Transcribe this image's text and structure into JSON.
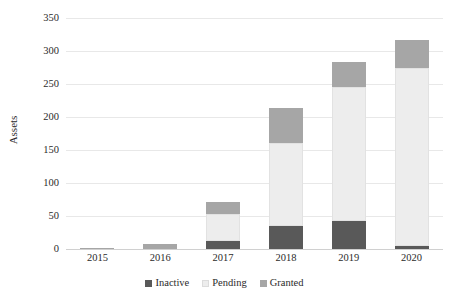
{
  "chart_data": {
    "type": "bar",
    "stacked": true,
    "title": "",
    "xlabel": "",
    "ylabel": "Assets",
    "categories": [
      "2015",
      "2016",
      "2017",
      "2018",
      "2019",
      "2020"
    ],
    "series": [
      {
        "name": "Inactive",
        "color": "#595959",
        "values": [
          0,
          0,
          12,
          35,
          43,
          5
        ]
      },
      {
        "name": "Pending",
        "color": "#ededed",
        "values": [
          0,
          0,
          41,
          126,
          203,
          270
        ]
      },
      {
        "name": "Granted",
        "color": "#a6a6a6",
        "values": [
          1,
          8,
          18,
          52,
          38,
          41
        ]
      }
    ],
    "totals": [
      1,
      8,
      71,
      213,
      284,
      316
    ],
    "ylim": [
      0,
      350
    ],
    "yticks": [
      0,
      50,
      100,
      150,
      200,
      250,
      300,
      350
    ],
    "ytick_labels": [
      "0",
      "50",
      "100",
      "150",
      "200",
      "250",
      "300",
      "350"
    ],
    "grid": "horizontal",
    "legend_position": "bottom",
    "legend_entries": [
      "Inactive",
      "Pending",
      "Granted"
    ]
  }
}
